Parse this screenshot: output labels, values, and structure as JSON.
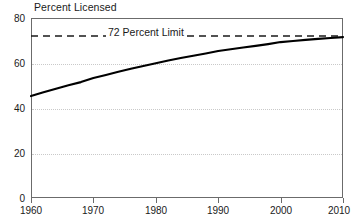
{
  "chart_data": {
    "type": "line",
    "title": "Percent Licensed",
    "xlabel": "",
    "ylabel": "",
    "xlim": [
      1960,
      2010
    ],
    "ylim": [
      0,
      80
    ],
    "grid": true,
    "legend": "none",
    "x_ticks": [
      "1960",
      "1970",
      "1980",
      "1990",
      "2000",
      "2010"
    ],
    "x_tick_values": [
      1960,
      1970,
      1980,
      1990,
      2000,
      2010
    ],
    "y_ticks": [
      "0",
      "20",
      "40",
      "60",
      "80"
    ],
    "y_tick_values": [
      0,
      20,
      40,
      60,
      80
    ],
    "gridline_values": [
      20,
      40,
      60
    ],
    "series": [
      {
        "name": "Percent Licensed",
        "style": "solid",
        "color": "#000000",
        "x": [
          1960,
          1962,
          1964,
          1966,
          1968,
          1970,
          1972,
          1974,
          1976,
          1978,
          1980,
          1982,
          1984,
          1986,
          1988,
          1990,
          1992,
          1994,
          1996,
          1998,
          2000,
          2002,
          2004,
          2006,
          2008,
          2010
        ],
        "values": [
          45.3,
          47.0,
          48.6,
          50.1,
          51.5,
          53.3,
          54.7,
          56.1,
          57.4,
          58.7,
          59.9,
          61.1,
          62.2,
          63.2,
          64.2,
          65.3,
          66.1,
          66.9,
          67.6,
          68.4,
          69.3,
          69.8,
          70.3,
          70.7,
          71.1,
          71.5
        ]
      }
    ],
    "annotations": [
      {
        "name": "limit-line",
        "label": "72 Percent Limit",
        "value": 72,
        "style": "dashed",
        "color": "#1a1a1a"
      }
    ]
  },
  "axis": {
    "y_label_80": "80",
    "y_label_60": "60",
    "y_label_40": "40",
    "y_label_20": "20",
    "y_label_0": "0",
    "x_label_1960": "1960",
    "x_label_1970": "1970",
    "x_label_1980": "1980",
    "x_label_1990": "1990",
    "x_label_2000": "2000",
    "x_label_2010": "2010"
  },
  "labels": {
    "title": "Percent Licensed",
    "limit": "72 Percent Limit"
  },
  "colors": {
    "series_line": "#000000",
    "limit_line": "#1a1a1a",
    "frame": "#6b6b6b",
    "gridline": "#c9c9c9",
    "background": "#ffffff"
  }
}
